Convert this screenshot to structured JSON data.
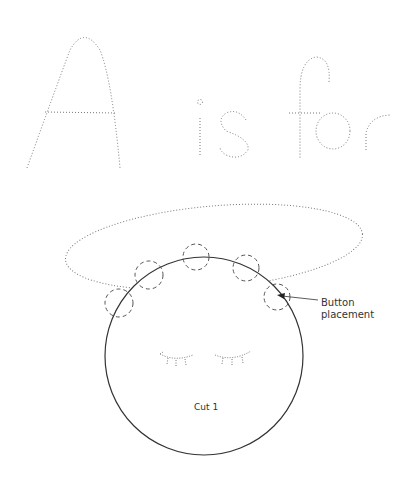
{
  "title": {
    "words": [
      "A",
      "is",
      "for"
    ],
    "style": "dotted-tracing-letters"
  },
  "pattern": {
    "shape": "circle-face",
    "cut_label": "Cut 1",
    "callout": {
      "line1": "Button",
      "line2": "placement"
    },
    "button_circles_count": 6,
    "features": [
      "closed-eye-left",
      "closed-eye-right",
      "hair-oval"
    ]
  },
  "colors": {
    "ink": "#333333",
    "dotted": "#777777",
    "background": "#ffffff"
  }
}
